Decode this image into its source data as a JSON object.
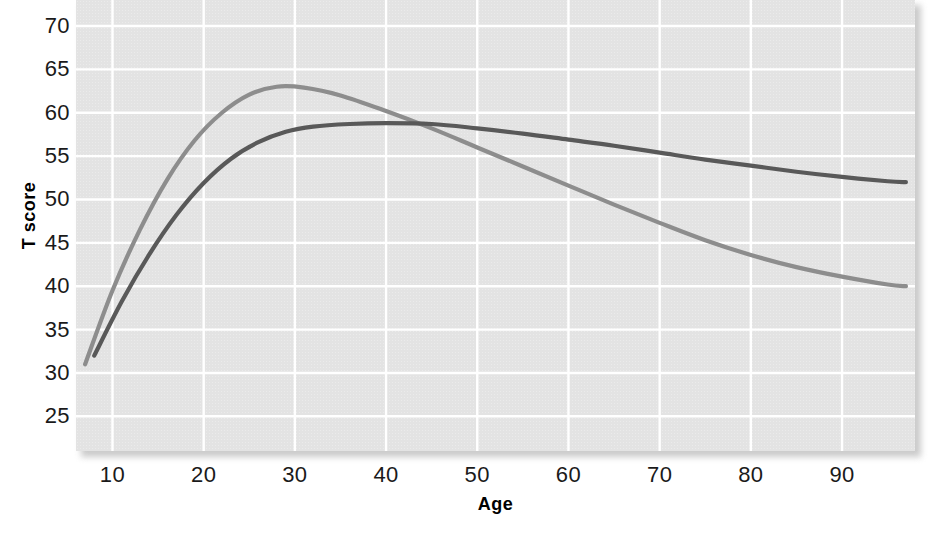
{
  "chart_data": {
    "type": "line",
    "title": "",
    "xlabel": "Age",
    "ylabel": "T score",
    "xlim": [
      6,
      98
    ],
    "ylim": [
      21,
      73
    ],
    "xticks": [
      10,
      20,
      30,
      40,
      50,
      60,
      70,
      80,
      90
    ],
    "yticks": [
      25,
      30,
      35,
      40,
      45,
      50,
      55,
      60,
      65,
      70
    ],
    "grid": true,
    "legend": "none",
    "background_color": "#e3e3e3",
    "gridline_color": "#ffffff",
    "series": [
      {
        "name": "light-gray-curve",
        "color": "#8d8d8d",
        "x": [
          7,
          10,
          13,
          16,
          19,
          22,
          25,
          28,
          31,
          35,
          40,
          45,
          50,
          55,
          60,
          65,
          70,
          75,
          80,
          85,
          90,
          95,
          97
        ],
        "y": [
          31.0,
          39.5,
          46.5,
          52.3,
          56.8,
          60.0,
          62.1,
          63.0,
          62.9,
          62.0,
          60.2,
          58.2,
          56.0,
          53.8,
          51.6,
          49.4,
          47.3,
          45.3,
          43.6,
          42.2,
          41.1,
          40.2,
          40.0
        ]
      },
      {
        "name": "dark-gray-curve",
        "color": "#595959",
        "x": [
          8,
          11,
          14,
          17,
          20,
          23,
          26,
          29,
          32,
          36,
          40,
          45,
          50,
          55,
          60,
          65,
          70,
          75,
          80,
          85,
          90,
          95,
          97
        ],
        "y": [
          32.0,
          38.2,
          43.6,
          48.2,
          51.9,
          54.7,
          56.6,
          57.8,
          58.4,
          58.7,
          58.8,
          58.7,
          58.2,
          57.6,
          56.9,
          56.2,
          55.4,
          54.6,
          53.9,
          53.2,
          52.6,
          52.1,
          52.0
        ]
      }
    ]
  },
  "axes": {
    "y_tick_labels": [
      "70",
      "65",
      "60",
      "55",
      "50",
      "45",
      "40",
      "35",
      "30",
      "25"
    ],
    "x_tick_labels": [
      "10",
      "20",
      "30",
      "40",
      "50",
      "60",
      "70",
      "80",
      "90"
    ],
    "y_axis_title": "T score",
    "x_axis_title": "Age"
  }
}
